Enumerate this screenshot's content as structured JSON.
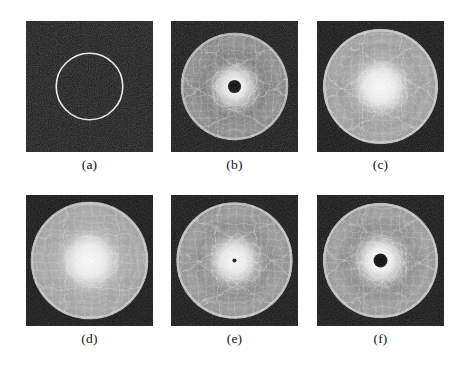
{
  "figure": {
    "background_color": "#ffffff",
    "columns": 3,
    "rows": 2,
    "panel_width": 127,
    "panel_height": 131,
    "label_font_size": 13.5
  },
  "chart_data": {
    "type": "heatmap",
    "title": "",
    "xlabel": "",
    "ylabel": "",
    "grid": false,
    "legend": "none",
    "panels": [
      {
        "label": "(a)",
        "kind": "circle-outline",
        "x": 26,
        "y": 21,
        "width": 127,
        "height": 131,
        "background_color": "#171717",
        "foreground_color": "#f2f2f2",
        "center_x": 0.5,
        "center_y": 0.5,
        "radius": 0.262,
        "stroke_width": 1.6,
        "center_core": "none",
        "petals": 0,
        "disc_radius": 0,
        "noise_opacity": 0.34,
        "halo_opacity": 0,
        "label_y": 158
      },
      {
        "label": "(b)",
        "kind": "rosette",
        "x": 171,
        "y": 21,
        "width": 127,
        "height": 131,
        "background_color": "#141414",
        "foreground_color": "#e8e8e8",
        "center_x": 0.5,
        "center_y": 0.5,
        "radius": 0.0,
        "stroke_width": 0,
        "center_core": "dark-disc",
        "core_radius": 0.052,
        "petals": 6,
        "petal_rx": 0.155,
        "petal_ry": 0.37,
        "disc_radius": 0.425,
        "noise_opacity": 0.3,
        "halo_opacity": 0.95,
        "halo_radius": 0.115,
        "rim_opacity": 0.55,
        "brightness": 0.72,
        "label_y": 158
      },
      {
        "label": "(c)",
        "kind": "rosette",
        "x": 317,
        "y": 21,
        "width": 127,
        "height": 131,
        "background_color": "#141414",
        "foreground_color": "#ffffff",
        "center_x": 0.5,
        "center_y": 0.5,
        "radius": 0.0,
        "stroke_width": 0,
        "center_core": "bright-star",
        "core_radius": 0.0,
        "petals": 6,
        "petal_rx": 0.16,
        "petal_ry": 0.4,
        "disc_radius": 0.455,
        "noise_opacity": 0.26,
        "halo_opacity": 1.0,
        "halo_radius": 0.155,
        "rim_opacity": 0.62,
        "brightness": 0.85,
        "label_y": 158
      },
      {
        "label": "(d)",
        "kind": "rosette",
        "x": 26,
        "y": 195,
        "width": 127,
        "height": 131,
        "background_color": "#141414",
        "foreground_color": "#ffffff",
        "center_x": 0.5,
        "center_y": 0.5,
        "radius": 0.0,
        "stroke_width": 0,
        "center_core": "bright-star",
        "core_radius": 0.0,
        "petals": 4,
        "petal_rx": 0.215,
        "petal_ry": 0.4,
        "disc_radius": 0.465,
        "noise_opacity": 0.24,
        "halo_opacity": 1.0,
        "halo_radius": 0.17,
        "rim_opacity": 0.58,
        "brightness": 0.88,
        "label_y": 332
      },
      {
        "label": "(e)",
        "kind": "rosette",
        "x": 171,
        "y": 195,
        "width": 127,
        "height": 131,
        "background_color": "#141414",
        "foreground_color": "#ffffff",
        "center_x": 0.5,
        "center_y": 0.5,
        "radius": 0.0,
        "stroke_width": 0,
        "center_core": "dot",
        "core_radius": 0.016,
        "petals": 6,
        "petal_rx": 0.15,
        "petal_ry": 0.41,
        "disc_radius": 0.46,
        "noise_opacity": 0.26,
        "halo_opacity": 0.98,
        "halo_radius": 0.13,
        "rim_opacity": 0.6,
        "brightness": 0.8,
        "label_y": 332
      },
      {
        "label": "(f)",
        "kind": "rosette",
        "x": 317,
        "y": 195,
        "width": 127,
        "height": 131,
        "background_color": "#141414",
        "foreground_color": "#ffffff",
        "center_x": 0.5,
        "center_y": 0.5,
        "radius": 0.0,
        "stroke_width": 0,
        "center_core": "dark-disc",
        "core_radius": 0.055,
        "petals": 6,
        "petal_rx": 0.155,
        "petal_ry": 0.4,
        "disc_radius": 0.455,
        "noise_opacity": 0.26,
        "halo_opacity": 1.0,
        "halo_radius": 0.125,
        "rim_opacity": 0.6,
        "brightness": 0.82,
        "label_y": 332
      }
    ]
  }
}
